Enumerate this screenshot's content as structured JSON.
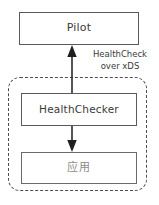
{
  "diagram": {
    "canvas": {
      "width": 159,
      "height": 205,
      "background": "#ffffff"
    },
    "nodes": [
      {
        "id": "pilot",
        "label": "Pilot",
        "shape": "rectangle",
        "fill": "#ffffff",
        "border_color": "#5a5a5a",
        "text_color": "#3a3a3a"
      },
      {
        "id": "healthchecker",
        "label": "HealthChecker",
        "shape": "rectangle",
        "fill": "#ffffff",
        "border_color": "#5a5a5a",
        "text_color": "#3a3a3a"
      },
      {
        "id": "application",
        "label": "应用",
        "shape": "rectangle",
        "fill": "#ffffff",
        "border_color": "#6a6a6a",
        "text_color": "#8c8c8c"
      }
    ],
    "group": {
      "id": "pod-boundary",
      "style": "dashed",
      "border_color": "#4d4d4d",
      "contains": [
        "healthchecker",
        "application"
      ]
    },
    "edges": [
      {
        "id": "healthchecker-to-pilot",
        "from": "healthchecker",
        "to": "pilot",
        "direction": "up",
        "arrowhead": "solid-triangle",
        "color": "#2b2b2b",
        "label_line1": "HealthCheck",
        "label_line2": "over xDS"
      },
      {
        "id": "healthchecker-to-application",
        "from": "healthchecker",
        "to": "application",
        "direction": "down",
        "arrowhead": "solid-triangle",
        "color": "#2b2b2b",
        "label_line1": "",
        "label_line2": ""
      }
    ]
  }
}
